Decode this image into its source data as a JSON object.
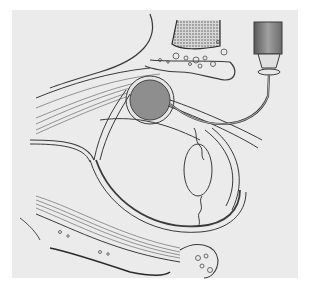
{
  "figure": {
    "text_labels": [],
    "colors": {
      "background": "#ffffff",
      "plate": "#ebebeb",
      "ink": "#3a3a3a",
      "nerve_sheath_fill": "#8e8e8e",
      "muscle_hatch": "#6b6b6b",
      "syringe_body": "#7a7a7a"
    },
    "parts": [
      {
        "id": "upper-orbital-bone",
        "label": ""
      },
      {
        "id": "lower-orbital-bone",
        "label": ""
      },
      {
        "id": "optic-nerve-round-section",
        "label": ""
      },
      {
        "id": "eyeball-sclera",
        "label": ""
      },
      {
        "id": "lens",
        "label": ""
      },
      {
        "id": "upper-eye-muscle",
        "label": ""
      },
      {
        "id": "lower-eye-muscle",
        "label": ""
      },
      {
        "id": "syringe",
        "label": ""
      },
      {
        "id": "needle",
        "label": ""
      }
    ]
  }
}
